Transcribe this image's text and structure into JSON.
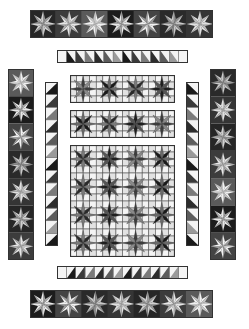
{
  "colors": {
    "background": "#ffffff",
    "outline": "#333333",
    "black": "#1a1a1a",
    "dark": "#3a3a3a",
    "mid_dark": "#5e5e5e",
    "mid": "#8a8a8a",
    "light": "#b8b8b8",
    "lighter": "#d6d6d6",
    "white": "#f4f4f4"
  },
  "sections": [
    {
      "id": "top-star-border",
      "type": "star-strip",
      "orientation": "horizontal",
      "x": 30,
      "y": 10,
      "w": 183,
      "h": 28,
      "count": 7
    },
    {
      "id": "top-hst-border",
      "type": "hst-strip",
      "orientation": "horizontal",
      "x": 57,
      "y": 50,
      "w": 131,
      "h": 13,
      "count": 12,
      "flip": false
    },
    {
      "id": "left-star-border",
      "type": "star-strip",
      "orientation": "vertical",
      "x": 8,
      "y": 69,
      "w": 26,
      "h": 191,
      "count": 7
    },
    {
      "id": "left-hst-border",
      "type": "hst-strip",
      "orientation": "vertical",
      "x": 45,
      "y": 82,
      "w": 13,
      "h": 164,
      "count": 13,
      "flip": false
    },
    {
      "id": "right-hst-border",
      "type": "hst-strip",
      "orientation": "vertical",
      "x": 186,
      "y": 82,
      "w": 13,
      "h": 164,
      "count": 13,
      "flip": true
    },
    {
      "id": "right-star-border",
      "type": "star-strip",
      "orientation": "vertical",
      "x": 210,
      "y": 69,
      "w": 26,
      "h": 191,
      "count": 7
    },
    {
      "id": "center-row-1",
      "type": "star-grid",
      "x": 70,
      "y": 75,
      "w": 105,
      "h": 28,
      "cols": 4,
      "rows": 1
    },
    {
      "id": "center-row-2",
      "type": "star-grid",
      "x": 70,
      "y": 110,
      "w": 105,
      "h": 28,
      "cols": 4,
      "rows": 1
    },
    {
      "id": "center-main-block",
      "type": "star-grid",
      "x": 70,
      "y": 145,
      "w": 105,
      "h": 112,
      "cols": 4,
      "rows": 4
    },
    {
      "id": "bottom-hst-border",
      "type": "hst-strip",
      "orientation": "horizontal",
      "x": 57,
      "y": 266,
      "w": 131,
      "h": 13,
      "count": 12,
      "flip": true
    },
    {
      "id": "bottom-star-border",
      "type": "star-strip",
      "orientation": "horizontal",
      "x": 30,
      "y": 290,
      "w": 183,
      "h": 28,
      "count": 7
    }
  ],
  "star_palettes": [
    {
      "bg": "#262626",
      "a": "#9a9a9a",
      "b": "#d0d0d0"
    },
    {
      "bg": "#3c3c3c",
      "a": "#e6e6e6",
      "b": "#b0b0b0"
    },
    {
      "bg": "#5a5a5a",
      "a": "#f0f0f0",
      "b": "#c4c4c4"
    },
    {
      "bg": "#1c1c1c",
      "a": "#a8a8a8",
      "b": "#e8e8e8"
    },
    {
      "bg": "#444444",
      "a": "#f2f2f2",
      "b": "#9c9c9c"
    },
    {
      "bg": "#2a2a2a",
      "a": "#8c8c8c",
      "b": "#c8c8c8"
    },
    {
      "bg": "#353535",
      "a": "#bcbcbc",
      "b": "#e0e0e0"
    }
  ],
  "grid_palettes": [
    {
      "a": "#2a2a2a",
      "b": "#7a7a7a"
    },
    {
      "a": "#555555",
      "b": "#1e1e1e"
    },
    {
      "a": "#8a8a8a",
      "b": "#3c3c3c"
    },
    {
      "a": "#1a1a1a",
      "b": "#6a6a6a"
    }
  ],
  "hst_shades": [
    "#1a1a1a",
    "#3a3a3a",
    "#7a7a7a",
    "#2c2c2c",
    "#5c5c5c",
    "#9a9a9a"
  ]
}
